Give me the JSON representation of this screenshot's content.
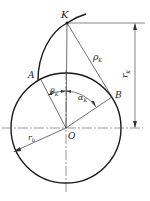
{
  "diagram": {
    "labels": {
      "K": "K",
      "A": "A",
      "B": "B",
      "O": "O",
      "rho_k": "ρ",
      "rho_k_sub": "K",
      "r_k": "r",
      "r_k_sub": "K",
      "theta_k": "θ",
      "theta_k_sub": "K",
      "alpha_k": "α",
      "alpha_k_sub": "K",
      "r_b": "r",
      "r_b_sub": "b"
    },
    "colors": {
      "line": "#1a1a1a",
      "thin": "#444444",
      "background": "#ffffff"
    }
  }
}
